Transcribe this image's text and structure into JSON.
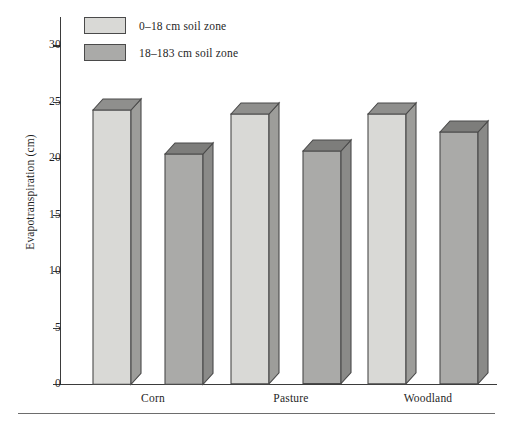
{
  "chart_data": {
    "type": "bar",
    "title": "",
    "xlabel": "",
    "ylabel": "Evapotranspiration (cm)",
    "categories": [
      "Corn",
      "Pasture",
      "Woodland"
    ],
    "series": [
      {
        "name": "0–18 cm soil zone",
        "values": [
          24.3,
          23.9,
          23.9
        ],
        "color": "#d9d9d6"
      },
      {
        "name": "18–183 cm soil zone",
        "values": [
          20.4,
          20.6,
          22.3
        ],
        "color": "#aaaaa8"
      }
    ],
    "ylim": [
      0,
      32.5
    ],
    "yticks": [
      0,
      5,
      10,
      15,
      20,
      25,
      30
    ],
    "ytick_labels": [
      "0",
      "5",
      "10",
      "15",
      "20",
      "25",
      "30"
    ],
    "grid": false,
    "legend_position": "top-left",
    "style": "3d-blocks"
  },
  "axis": {
    "y_title": "Evapotranspiration (cm)",
    "ticks": [
      {
        "value": 30,
        "label": "30"
      },
      {
        "value": 25,
        "label": "25"
      },
      {
        "value": 20,
        "label": "20"
      },
      {
        "value": 15,
        "label": "15"
      },
      {
        "value": 10,
        "label": "10"
      },
      {
        "value": 5,
        "label": "5"
      },
      {
        "value": 0,
        "label": "0"
      }
    ]
  },
  "legend": {
    "items": [
      {
        "label": "0–18 cm soil zone",
        "color": "#d9d9d6"
      },
      {
        "label": "18–183 cm soil zone",
        "color": "#aaaaa8"
      }
    ]
  },
  "categories": [
    {
      "label": "Corn"
    },
    {
      "label": "Pasture"
    },
    {
      "label": "Woodland"
    }
  ],
  "colors": {
    "light_fill": "#d9d9d6",
    "dark_fill": "#aaaaa8",
    "light_side": "#9d9d9a",
    "dark_side": "#8a8a88",
    "light_top": "#8f8f8d",
    "dark_top": "#7d7d7b",
    "outline": "#4a4a4a",
    "axis": "#3b3b3b",
    "rule": "#6d6d6d",
    "text": "#1f1f1f",
    "background": "#ffffff"
  }
}
